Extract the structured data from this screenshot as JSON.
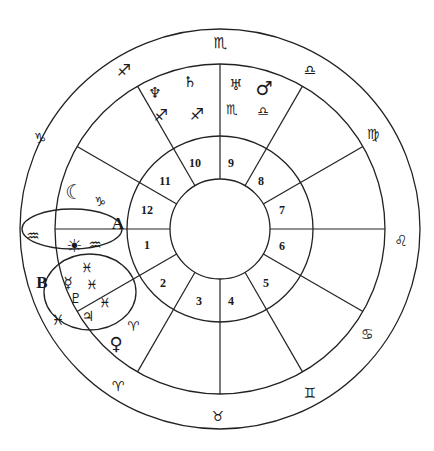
{
  "chart": {
    "center": [
      220,
      229
    ],
    "radii": {
      "outer": 200,
      "zodiac_inner": 165,
      "house_ring": 93,
      "core": 50
    },
    "house_numbers": [
      {
        "label": "1",
        "x": 147,
        "y": 245
      },
      {
        "label": "2",
        "x": 163,
        "y": 283
      },
      {
        "label": "3",
        "x": 199,
        "y": 301
      },
      {
        "label": "4",
        "x": 231,
        "y": 301
      },
      {
        "label": "5",
        "x": 266,
        "y": 283
      },
      {
        "label": "6",
        "x": 282,
        "y": 246
      },
      {
        "label": "7",
        "x": 282,
        "y": 210
      },
      {
        "label": "8",
        "x": 261,
        "y": 181
      },
      {
        "label": "9",
        "x": 231,
        "y": 163
      },
      {
        "label": "10",
        "x": 195,
        "y": 163
      },
      {
        "label": "11",
        "x": 165,
        "y": 181
      },
      {
        "label": "12",
        "x": 147,
        "y": 210
      }
    ],
    "zodiac_signs": [
      {
        "name": "scorpio",
        "glyph": "♏",
        "x": 220,
        "y": 43
      },
      {
        "name": "libra",
        "glyph": "♎",
        "x": 310,
        "y": 70
      },
      {
        "name": "virgo",
        "glyph": "♍",
        "x": 373,
        "y": 134
      },
      {
        "name": "leo",
        "glyph": "♌",
        "x": 401,
        "y": 241
      },
      {
        "name": "cancer",
        "glyph": "♋",
        "x": 367,
        "y": 334
      },
      {
        "name": "gemini",
        "glyph": "♊",
        "x": 310,
        "y": 393
      },
      {
        "name": "taurus",
        "glyph": "♉",
        "x": 218,
        "y": 416
      },
      {
        "name": "aries",
        "glyph": "♈",
        "x": 118,
        "y": 386
      },
      {
        "name": "sagittarius",
        "glyph": "♐",
        "x": 124,
        "y": 70
      },
      {
        "name": "capricorn",
        "glyph": "♑",
        "x": 40,
        "y": 138
      },
      {
        "name": "aquarius",
        "glyph": "♒",
        "x": 33,
        "y": 236
      }
    ],
    "placements": [
      {
        "name": "neptune",
        "glyph": "♆",
        "x": 155,
        "y": 93
      },
      {
        "name": "saturn",
        "glyph": "♄",
        "x": 190,
        "y": 82
      },
      {
        "name": "sagittarius-a",
        "glyph": "♐",
        "x": 161,
        "y": 115
      },
      {
        "name": "sagittarius-b",
        "glyph": "♐",
        "x": 197,
        "y": 114
      },
      {
        "name": "uranus",
        "glyph": "♅",
        "x": 236,
        "y": 85
      },
      {
        "name": "mars",
        "glyph": "♂",
        "x": 264,
        "y": 88
      },
      {
        "name": "scorpio-inner",
        "glyph": "♏",
        "x": 232,
        "y": 109
      },
      {
        "name": "libra-inner",
        "glyph": "♎",
        "x": 263,
        "y": 111
      },
      {
        "name": "moon",
        "glyph": "☾",
        "x": 74,
        "y": 192
      },
      {
        "name": "capricorn-inner",
        "glyph": "♑",
        "x": 100,
        "y": 201
      },
      {
        "name": "sun",
        "glyph": "☀",
        "x": 74,
        "y": 245
      },
      {
        "name": "aquarius-inner",
        "glyph": "♒",
        "x": 95,
        "y": 245
      },
      {
        "name": "pisces-a",
        "glyph": "♓",
        "x": 87,
        "y": 267
      },
      {
        "name": "mercury",
        "glyph": "☿",
        "x": 68,
        "y": 283
      },
      {
        "name": "pisces-b",
        "glyph": "♓",
        "x": 92,
        "y": 284
      },
      {
        "name": "pluto",
        "glyph": "♇",
        "x": 76,
        "y": 298
      },
      {
        "name": "pisces-c",
        "glyph": "♓",
        "x": 105,
        "y": 302
      },
      {
        "name": "jupiter",
        "glyph": "♃",
        "x": 88,
        "y": 316
      },
      {
        "name": "pisces-d",
        "glyph": "♓",
        "x": 58,
        "y": 320
      },
      {
        "name": "aries-inner",
        "glyph": "♈",
        "x": 133,
        "y": 326
      },
      {
        "name": "venus",
        "glyph": "♀",
        "x": 116,
        "y": 343
      }
    ],
    "highlights": [
      {
        "label": "A",
        "x": 118,
        "y": 223
      },
      {
        "label": "B",
        "x": 42,
        "y": 282
      }
    ]
  }
}
